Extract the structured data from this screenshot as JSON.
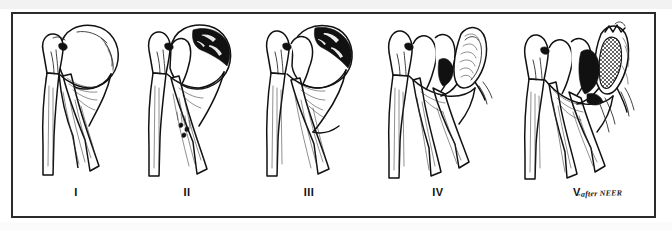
{
  "figure": {
    "attribution": "-after NEER",
    "frame_color": "#2b2b2b",
    "ink_color": "#111111",
    "background_color": "#ffffff",
    "panels": [
      {
        "label": "I",
        "name": "panel-one",
        "description": "Intact / minimally displaced proximal humerus"
      },
      {
        "label": "II",
        "name": "panel-two",
        "description": "Displaced anatomical neck fragment with stippled fracture zone"
      },
      {
        "label": "III",
        "name": "panel-three",
        "description": "Displaced surgical neck fracture"
      },
      {
        "label": "IV",
        "name": "panel-four",
        "description": "Three-part fracture with laterally displaced tuberosity fragment"
      },
      {
        "label": "V",
        "name": "panel-five",
        "description": "Four-part fracture with cross-hatched displaced head fragment"
      }
    ]
  }
}
